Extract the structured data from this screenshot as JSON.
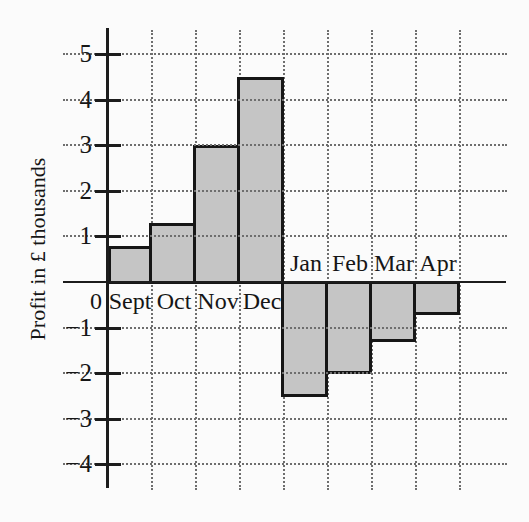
{
  "chart_data": {
    "type": "bar",
    "title": "",
    "xlabel": "",
    "ylabel": "Profit in £ thousands",
    "categories": [
      "Sept",
      "Oct",
      "Nov",
      "Dec",
      "Jan",
      "Feb",
      "Mar",
      "Apr"
    ],
    "values": [
      0.8,
      1.3,
      3.0,
      4.5,
      -2.5,
      -2.0,
      -1.3,
      -0.7
    ],
    "y_ticks": [
      5,
      4,
      3,
      2,
      1,
      -1,
      -2,
      -3,
      -4
    ],
    "y_tick_labels": [
      "5",
      "4",
      "3",
      "2",
      "1",
      "−1",
      "−2",
      "−3",
      "−4"
    ],
    "origin_label": "0",
    "ylim": [
      -4.6,
      5.5
    ],
    "grid": true,
    "legend": null,
    "label_placement": "positive bars labeled below x-axis, negative bars labeled above x-axis",
    "colors": {
      "bar_fill": "#c5c5c5",
      "bar_border": "#161616",
      "grid": "#6e6e6e",
      "axis": "#1c1c1c",
      "background": "#fbfbfb",
      "text": "#161616"
    }
  }
}
